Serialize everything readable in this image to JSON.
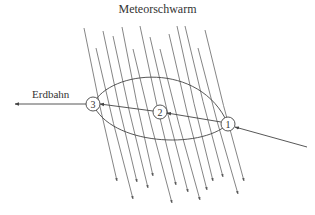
{
  "diagram": {
    "title": "Meteorschwarm",
    "orbit_label": "Erdbahn",
    "points": [
      {
        "id": "1",
        "label": "1",
        "x": 228,
        "y": 124
      },
      {
        "id": "2",
        "label": "2",
        "x": 160,
        "y": 112
      },
      {
        "id": "3",
        "label": "3",
        "x": 93,
        "y": 104
      }
    ],
    "meteor_lines": [
      {
        "x1": 84,
        "y1": 28,
        "x2": 117,
        "y2": 181
      },
      {
        "x1": 96,
        "y1": 48,
        "x2": 133,
        "y2": 199
      },
      {
        "x1": 103,
        "y1": 31,
        "x2": 137,
        "y2": 182
      },
      {
        "x1": 113,
        "y1": 36,
        "x2": 148,
        "y2": 188
      },
      {
        "x1": 122,
        "y1": 27,
        "x2": 153,
        "y2": 176
      },
      {
        "x1": 133,
        "y1": 49,
        "x2": 172,
        "y2": 203
      },
      {
        "x1": 140,
        "y1": 26,
        "x2": 176,
        "y2": 185
      },
      {
        "x1": 150,
        "y1": 37,
        "x2": 188,
        "y2": 192
      },
      {
        "x1": 160,
        "y1": 49,
        "x2": 200,
        "y2": 200
      },
      {
        "x1": 169,
        "y1": 34,
        "x2": 207,
        "y2": 190
      },
      {
        "x1": 177,
        "y1": 26,
        "x2": 213,
        "y2": 181
      },
      {
        "x1": 185,
        "y1": 26,
        "x2": 223,
        "y2": 177
      },
      {
        "x1": 198,
        "y1": 48,
        "x2": 238,
        "y2": 194
      },
      {
        "x1": 205,
        "y1": 30,
        "x2": 244,
        "y2": 181
      }
    ],
    "colors": {
      "line": "#555555",
      "text": "#333333",
      "background": "#ffffff"
    }
  }
}
